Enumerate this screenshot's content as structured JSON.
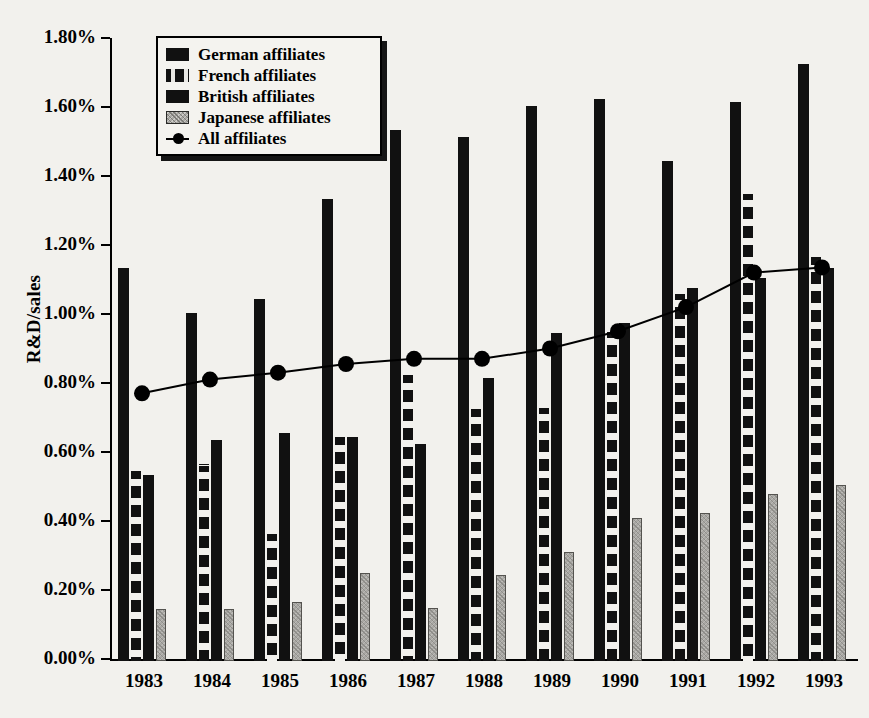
{
  "chart_data": {
    "type": "bar",
    "title": "",
    "xlabel": "",
    "ylabel": "R&D/sales",
    "categories": [
      "1983",
      "1984",
      "1985",
      "1986",
      "1987",
      "1988",
      "1989",
      "1990",
      "1991",
      "1992",
      "1993"
    ],
    "ylim": [
      0,
      1.8
    ],
    "ytick_values": [
      0.0,
      0.2,
      0.4,
      0.6,
      0.8,
      1.0,
      1.2,
      1.4,
      1.6,
      1.8
    ],
    "ytick_labels": [
      "0.00%",
      "0.20%",
      "0.40%",
      "0.60%",
      "0.80%",
      "1.00%",
      "1.20%",
      "1.40%",
      "1.60%",
      "1.80%"
    ],
    "grid": false,
    "legend_position": "top-left",
    "units": "percent",
    "series": [
      {
        "name": "German affiliates",
        "kind": "bar",
        "pattern": "solid-black",
        "color": "#111111",
        "values": [
          1.14,
          1.01,
          1.05,
          1.34,
          1.54,
          1.52,
          1.61,
          1.63,
          1.45,
          1.62,
          1.73
        ]
      },
      {
        "name": "French affiliates",
        "kind": "bar",
        "pattern": "black-with-white-squares",
        "color": "#111111",
        "values": [
          0.55,
          0.57,
          0.37,
          0.65,
          0.83,
          0.73,
          0.74,
          0.96,
          1.07,
          1.36,
          1.17
        ]
      },
      {
        "name": "British affiliates",
        "kind": "bar",
        "pattern": "solid-black",
        "color": "#111111",
        "values": [
          0.54,
          0.64,
          0.66,
          0.65,
          0.63,
          0.82,
          0.95,
          0.98,
          1.08,
          1.11,
          1.14
        ]
      },
      {
        "name": "Japanese affiliates",
        "kind": "bar",
        "pattern": "stippled-gray",
        "color": "#a9a8a4",
        "values": [
          0.15,
          0.15,
          0.17,
          0.255,
          0.155,
          0.25,
          0.315,
          0.415,
          0.43,
          0.485,
          0.51
        ]
      },
      {
        "name": "All affiliates",
        "kind": "line",
        "marker": "filled-circle",
        "color": "#000000",
        "values": [
          0.77,
          0.81,
          0.83,
          0.855,
          0.87,
          0.87,
          0.9,
          0.95,
          1.02,
          1.12,
          1.135
        ]
      }
    ]
  },
  "legend": {
    "items": [
      {
        "label": "German affiliates",
        "swatch": "sw-german"
      },
      {
        "label": "French affiliates",
        "swatch": "sw-french"
      },
      {
        "label": "British affiliates",
        "swatch": "sw-british"
      },
      {
        "label": "Japanese affiliates",
        "swatch": "sw-japanese"
      },
      {
        "label": "All affiliates",
        "swatch": "sw-line"
      }
    ]
  },
  "colors": {
    "background": "#f2f1ed",
    "ink": "#000000",
    "bar_dark": "#111111",
    "bar_gray": "#a9a8a4"
  }
}
